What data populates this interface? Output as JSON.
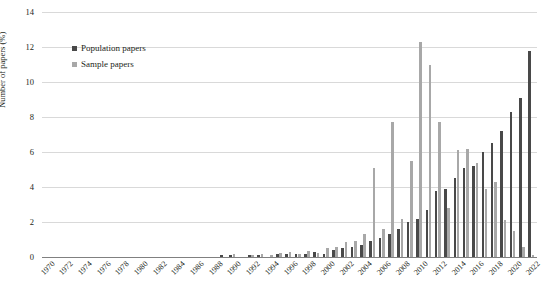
{
  "chart_data": {
    "type": "bar",
    "title": "",
    "xlabel": "",
    "ylabel": "Number of papers (%)",
    "ylim": [
      0,
      14
    ],
    "ytick_labels": [
      "0",
      "2",
      "4",
      "6",
      "8",
      "10",
      "12",
      "14"
    ],
    "ytick_values": [
      0,
      2,
      4,
      6,
      8,
      10,
      12,
      14
    ],
    "grid": "horizontal",
    "legend_position": "top-left-inside",
    "x_tick_step": 2,
    "categories": [
      "1970",
      "1971",
      "1972",
      "1973",
      "1974",
      "1975",
      "1976",
      "1977",
      "1978",
      "1979",
      "1980",
      "1981",
      "1982",
      "1983",
      "1984",
      "1985",
      "1986",
      "1987",
      "1988",
      "1989",
      "1990",
      "1991",
      "1992",
      "1993",
      "1994",
      "1995",
      "1996",
      "1997",
      "1998",
      "1999",
      "2000",
      "2001",
      "2002",
      "2003",
      "2004",
      "2005",
      "2006",
      "2007",
      "2008",
      "2009",
      "2010",
      "2011",
      "2012",
      "2013",
      "2014",
      "2015",
      "2016",
      "2017",
      "2018",
      "2019",
      "2020",
      "2021",
      "2022"
    ],
    "xtick_labels": [
      "1970",
      "1972",
      "1974",
      "1976",
      "1978",
      "1980",
      "1982",
      "1984",
      "1986",
      "1988",
      "1990",
      "1992",
      "1994",
      "1996",
      "1998",
      "2000",
      "2002",
      "2004",
      "2006",
      "2008",
      "2010",
      "2012",
      "2014",
      "2016",
      "2018",
      "2020",
      "2022"
    ],
    "series": [
      {
        "name": "Population papers",
        "color": "#494949",
        "values": [
          0,
          0,
          0,
          0,
          0,
          0,
          0,
          0,
          0,
          0,
          0,
          0,
          0,
          0,
          0,
          0,
          0,
          0,
          0,
          0.1,
          0.1,
          0,
          0.1,
          0.1,
          0,
          0.2,
          0.2,
          0.15,
          0.2,
          0.3,
          0.2,
          0.4,
          0.5,
          0.55,
          0.7,
          0.9,
          1.1,
          1.3,
          1.6,
          2.0,
          2.2,
          2.7,
          3.8,
          3.9,
          4.5,
          5.1,
          5.2,
          6.0,
          6.5,
          7.2,
          8.3,
          9.1,
          11.8
        ]
      },
      {
        "name": "Sample papers",
        "color": "#a8a8a8",
        "values": [
          0,
          0,
          0,
          0,
          0,
          0,
          0,
          0,
          0,
          0,
          0,
          0,
          0,
          0,
          0,
          0,
          0,
          0,
          0,
          0,
          0.15,
          0,
          0.1,
          0.15,
          0.1,
          0.25,
          0.3,
          0.2,
          0.35,
          0.25,
          0.5,
          0.55,
          0.85,
          0.9,
          1.3,
          5.1,
          1.6,
          7.7,
          2.2,
          5.5,
          12.3,
          11.0,
          7.7,
          2.8,
          6.1,
          6.2,
          5.4,
          3.9,
          4.3,
          2.1,
          1.5,
          0.6,
          0.1
        ]
      }
    ]
  },
  "legend": {
    "items": [
      {
        "label": "Population papers",
        "key": "pop"
      },
      {
        "label": "Sample papers",
        "key": "samp"
      }
    ]
  },
  "axis": {
    "y_title": "Number of papers (%)"
  }
}
